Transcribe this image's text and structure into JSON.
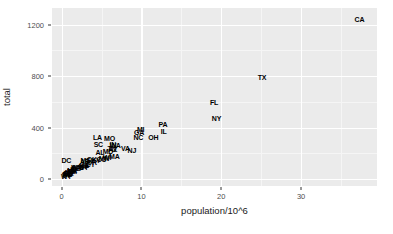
{
  "chart_data": {
    "type": "scatter",
    "title": "",
    "subtitle": "",
    "xlabel": "population/10^6",
    "ylabel": "total",
    "xlim": [
      -1.2,
      39.5
    ],
    "ylim": [
      -55,
      1330
    ],
    "xticks": [
      0,
      10,
      20,
      30
    ],
    "xtick_labels": [
      "0",
      "10",
      "20",
      "30"
    ],
    "yticks": [
      0,
      400,
      800,
      1200
    ],
    "ytick_labels": [
      "0",
      "400",
      "800",
      "1200"
    ],
    "x_minor_ticks": [
      5,
      15,
      25,
      35
    ],
    "y_minor_ticks": [
      200,
      600,
      1000
    ],
    "grid": true,
    "legend": "none",
    "point_marker": "text-label",
    "panel_background": "#ebebeb",
    "grid_color": "#ffffff",
    "text_color": "#000000",
    "points": [
      {
        "label": "CA",
        "x": 37.3,
        "y": 1244
      },
      {
        "label": "TX",
        "x": 25.1,
        "y": 790
      },
      {
        "label": "FL",
        "x": 19.1,
        "y": 600
      },
      {
        "label": "NY",
        "x": 19.4,
        "y": 476
      },
      {
        "label": "PA",
        "x": 12.7,
        "y": 426
      },
      {
        "label": "IL",
        "x": 12.8,
        "y": 376
      },
      {
        "label": "MI",
        "x": 9.9,
        "y": 390
      },
      {
        "label": "GA",
        "x": 9.7,
        "y": 362
      },
      {
        "label": "OH",
        "x": 11.5,
        "y": 330
      },
      {
        "label": "NC",
        "x": 9.6,
        "y": 326
      },
      {
        "label": "MO",
        "x": 6.0,
        "y": 318
      },
      {
        "label": "LA",
        "x": 4.5,
        "y": 330
      },
      {
        "label": "SC",
        "x": 4.6,
        "y": 268
      },
      {
        "label": "IN",
        "x": 6.4,
        "y": 272
      },
      {
        "label": "WA",
        "x": 6.7,
        "y": 262
      },
      {
        "label": "VA",
        "x": 8.0,
        "y": 244
      },
      {
        "label": "TN",
        "x": 6.3,
        "y": 240
      },
      {
        "label": "AZ",
        "x": 6.4,
        "y": 230
      },
      {
        "label": "NJ",
        "x": 8.8,
        "y": 222
      },
      {
        "label": "MD",
        "x": 5.8,
        "y": 215
      },
      {
        "label": "AL",
        "x": 4.8,
        "y": 208
      },
      {
        "label": "MA",
        "x": 6.6,
        "y": 178
      },
      {
        "label": "WI",
        "x": 5.7,
        "y": 168
      },
      {
        "label": "MN",
        "x": 5.3,
        "y": 160
      },
      {
        "label": "CO",
        "x": 5.0,
        "y": 155
      },
      {
        "label": "OK",
        "x": 3.8,
        "y": 152
      },
      {
        "label": "KY",
        "x": 4.3,
        "y": 148
      },
      {
        "label": "MS",
        "x": 3.0,
        "y": 145
      },
      {
        "label": "AR",
        "x": 2.9,
        "y": 140
      },
      {
        "label": "OR",
        "x": 3.8,
        "y": 132
      },
      {
        "label": "DC",
        "x": 0.6,
        "y": 150
      },
      {
        "label": "CT",
        "x": 3.6,
        "y": 120
      },
      {
        "label": "IA",
        "x": 3.0,
        "y": 112
      },
      {
        "label": "KS",
        "x": 2.8,
        "y": 108
      },
      {
        "label": "NV",
        "x": 2.7,
        "y": 104
      },
      {
        "label": "UT",
        "x": 2.8,
        "y": 96
      },
      {
        "label": "NM",
        "x": 2.0,
        "y": 95
      },
      {
        "label": "WV",
        "x": 1.9,
        "y": 90
      },
      {
        "label": "NE",
        "x": 1.8,
        "y": 82
      },
      {
        "label": "ID",
        "x": 1.5,
        "y": 76
      },
      {
        "label": "ME",
        "x": 1.3,
        "y": 70
      },
      {
        "label": "NH",
        "x": 1.3,
        "y": 64
      },
      {
        "label": "HI",
        "x": 1.3,
        "y": 62
      },
      {
        "label": "RI",
        "x": 1.1,
        "y": 58
      },
      {
        "label": "MT",
        "x": 1.0,
        "y": 52
      },
      {
        "label": "DE",
        "x": 0.9,
        "y": 48
      },
      {
        "label": "SD",
        "x": 0.8,
        "y": 44
      },
      {
        "label": "AK",
        "x": 0.7,
        "y": 40
      },
      {
        "label": "ND",
        "x": 0.7,
        "y": 36
      },
      {
        "label": "VT",
        "x": 0.6,
        "y": 30
      },
      {
        "label": "WY",
        "x": 0.6,
        "y": 26
      }
    ]
  }
}
